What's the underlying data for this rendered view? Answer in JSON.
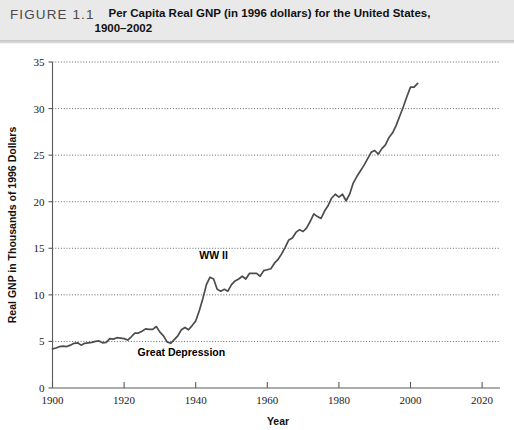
{
  "header": {
    "figure_number": "FIGURE 1.1",
    "caption_line1": "Per Capita Real GNP (in 1996 dollars) for the United States,",
    "caption_line2": "1900–2002",
    "band_color": "#e9e9e9"
  },
  "chart_data": {
    "type": "line",
    "title": "Per Capita Real GNP (in 1996 dollars) for the United States, 1900–2002",
    "xlabel": "Year",
    "ylabel": "Real GNP in Thousands of 1996 Dollars",
    "xlim": [
      1900,
      2025
    ],
    "ylim": [
      0,
      35
    ],
    "xticks": [
      1900,
      1920,
      1940,
      1960,
      1980,
      2000,
      2020
    ],
    "yticks": [
      0,
      5,
      10,
      15,
      20,
      25,
      30,
      35
    ],
    "xtick_labels": [
      "1900",
      "1920",
      "1940",
      "1960",
      "1980",
      "2000",
      "2020"
    ],
    "ytick_labels": [
      "0",
      "5",
      "10",
      "15",
      "20",
      "25",
      "30",
      "35"
    ],
    "grid": "horizontal-dotted",
    "legend": "none",
    "line_color": "#4c4c4c",
    "annotations": [
      {
        "text": "WW II",
        "x": 1945,
        "y": 13.9
      },
      {
        "text": "Great Depression",
        "x": 1936,
        "y": 3.4
      }
    ],
    "series": [
      {
        "name": "Per Capita Real GNP",
        "x": [
          1900,
          1901,
          1902,
          1903,
          1904,
          1905,
          1906,
          1907,
          1908,
          1909,
          1910,
          1911,
          1912,
          1913,
          1914,
          1915,
          1916,
          1917,
          1918,
          1919,
          1920,
          1921,
          1922,
          1923,
          1924,
          1925,
          1926,
          1927,
          1928,
          1929,
          1930,
          1931,
          1932,
          1933,
          1934,
          1935,
          1936,
          1937,
          1938,
          1939,
          1940,
          1941,
          1942,
          1943,
          1944,
          1945,
          1946,
          1947,
          1948,
          1949,
          1950,
          1951,
          1952,
          1953,
          1954,
          1955,
          1956,
          1957,
          1958,
          1959,
          1960,
          1961,
          1962,
          1963,
          1964,
          1965,
          1966,
          1967,
          1968,
          1969,
          1970,
          1971,
          1972,
          1973,
          1974,
          1975,
          1976,
          1977,
          1978,
          1979,
          1980,
          1981,
          1982,
          1983,
          1984,
          1985,
          1986,
          1987,
          1988,
          1989,
          1990,
          1991,
          1992,
          1993,
          1994,
          1995,
          1996,
          1997,
          1998,
          1999,
          2000,
          2001,
          2002
        ],
        "values": [
          4.2,
          4.3,
          4.45,
          4.5,
          4.45,
          4.6,
          4.8,
          4.85,
          4.6,
          4.8,
          4.85,
          4.9,
          5.0,
          5.05,
          4.85,
          4.9,
          5.3,
          5.25,
          5.4,
          5.35,
          5.3,
          5.15,
          5.5,
          5.9,
          5.9,
          6.1,
          6.35,
          6.3,
          6.3,
          6.6,
          6.0,
          5.6,
          4.95,
          4.8,
          5.2,
          5.6,
          6.25,
          6.5,
          6.25,
          6.7,
          7.2,
          8.3,
          9.6,
          11.1,
          11.9,
          11.7,
          10.6,
          10.4,
          10.6,
          10.4,
          11.1,
          11.5,
          11.7,
          12.0,
          11.7,
          12.3,
          12.3,
          12.3,
          12.0,
          12.6,
          12.7,
          12.8,
          13.4,
          13.8,
          14.4,
          15.1,
          15.9,
          16.1,
          16.7,
          17.0,
          16.8,
          17.2,
          17.9,
          18.7,
          18.4,
          18.2,
          19.0,
          19.6,
          20.4,
          20.8,
          20.5,
          20.8,
          20.1,
          20.8,
          22.0,
          22.7,
          23.3,
          23.9,
          24.6,
          25.3,
          25.5,
          25.1,
          25.7,
          26.1,
          26.9,
          27.4,
          28.2,
          29.2,
          30.2,
          31.3,
          32.3,
          32.3,
          32.7
        ]
      }
    ]
  }
}
